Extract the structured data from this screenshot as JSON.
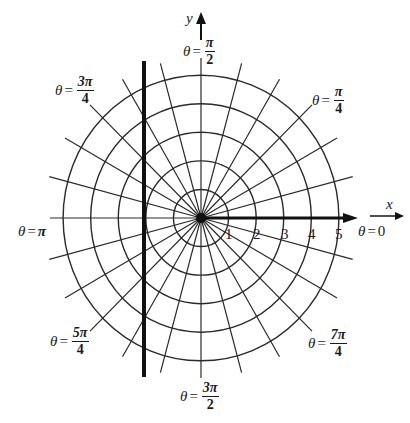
{
  "diagram": {
    "type": "polar-grid",
    "center": {
      "x": 201,
      "y": 218
    },
    "ring_spacing_px": 28,
    "ring_count": 5,
    "radial_step_degrees": 15,
    "line_color": "#2a2a2a",
    "bold_line_color": "#111111",
    "vertical_bold_line_x": 144
  },
  "axes": {
    "x_label": "x",
    "y_label": "y"
  },
  "ticks": [
    "1",
    "2",
    "3",
    "4",
    "5"
  ],
  "angle_labels": {
    "theta_symbol": "θ",
    "equals": "=",
    "zero": {
      "value": "0"
    },
    "pi": {
      "value": "π"
    },
    "pi_over_2": {
      "num": "π",
      "den": "2"
    },
    "pi_over_4": {
      "num": "π",
      "den": "4"
    },
    "three_pi_over_4": {
      "num": "3π",
      "den": "4"
    },
    "five_pi_over_4": {
      "num": "5π",
      "den": "4"
    },
    "three_pi_over_2": {
      "num": "3π",
      "den": "2"
    },
    "seven_pi_over_4": {
      "num": "7π",
      "den": "4"
    }
  }
}
